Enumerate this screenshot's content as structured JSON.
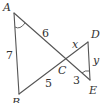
{
  "diagram": {
    "points": {
      "A": {
        "label": "A",
        "x": 14,
        "y": 13
      },
      "B": {
        "label": "B",
        "x": 19,
        "y": 94
      },
      "C": {
        "label": "C",
        "x": 65,
        "y": 60
      },
      "D": {
        "label": "D",
        "x": 88,
        "y": 42
      },
      "E": {
        "label": "E",
        "x": 90,
        "y": 80
      }
    },
    "segment_labels": {
      "AC": "6",
      "AB": "7",
      "BC": "5",
      "CE": "3",
      "CD": "x",
      "DE": "y"
    },
    "angle_marks": [
      "A",
      "E"
    ],
    "colors": {
      "stroke": "#555555",
      "text": "#333333",
      "background": "#ffffff"
    }
  }
}
